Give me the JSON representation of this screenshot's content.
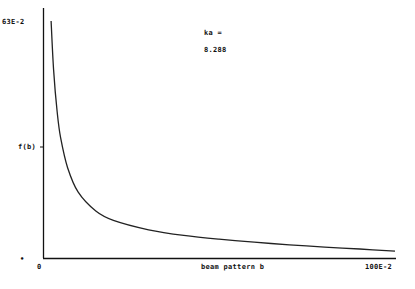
{
  "chart_data": {
    "type": "line",
    "title": "",
    "xlabel": "beam pattern b",
    "ylabel": "f(b)",
    "x_ticks": [
      "0",
      "100E-2"
    ],
    "y_ticks": [
      "0",
      "63E-2"
    ],
    "xlim": [
      0,
      1.0
    ],
    "ylim": [
      0,
      0.63
    ],
    "grid": false,
    "annotation": {
      "label": "ka =",
      "value": "8.288"
    },
    "series": [
      {
        "name": "f(b)",
        "x": [
          0.023,
          0.03,
          0.04,
          0.05,
          0.07,
          0.1,
          0.15,
          0.2,
          0.3,
          0.4,
          0.5,
          0.6,
          0.7,
          0.8,
          0.9,
          1.0
        ],
        "values": [
          0.63,
          0.5,
          0.39,
          0.32,
          0.24,
          0.175,
          0.125,
          0.1,
          0.075,
          0.06,
          0.05,
          0.042,
          0.035,
          0.029,
          0.024,
          0.018
        ]
      }
    ]
  }
}
